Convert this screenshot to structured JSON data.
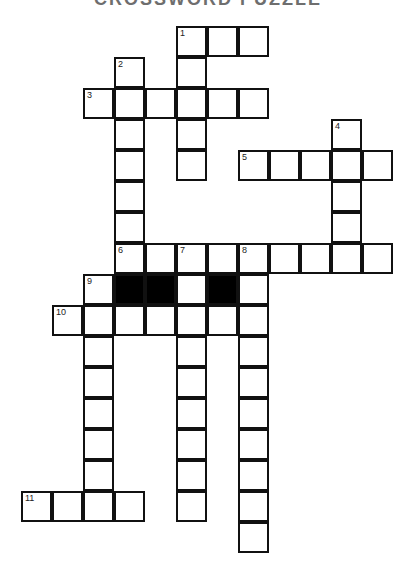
{
  "title": "CROSSWORD PUZZLE",
  "grid": {
    "origin_x": 22,
    "origin_y": 27,
    "cell_size": 31,
    "border_color": "#111111",
    "block_color": "#000000"
  },
  "clue_numbers": [
    {
      "number": "1",
      "row": 0,
      "col": 5
    },
    {
      "number": "2",
      "row": 1,
      "col": 3
    },
    {
      "number": "3",
      "row": 2,
      "col": 2
    },
    {
      "number": "4",
      "row": 3,
      "col": 10
    },
    {
      "number": "5",
      "row": 4,
      "col": 7
    },
    {
      "number": "6",
      "row": 7,
      "col": 3
    },
    {
      "number": "7",
      "row": 7,
      "col": 5
    },
    {
      "number": "8",
      "row": 7,
      "col": 7
    },
    {
      "number": "9",
      "row": 8,
      "col": 2
    },
    {
      "number": "10",
      "row": 9,
      "col": 1
    },
    {
      "number": "11",
      "row": 15,
      "col": 0
    }
  ],
  "entries": [
    {
      "number": "1",
      "direction": "across",
      "row": 0,
      "col": 5,
      "length": 3
    },
    {
      "number": "1",
      "direction": "down",
      "row": 0,
      "col": 5,
      "length": 5
    },
    {
      "number": "2",
      "direction": "down",
      "row": 1,
      "col": 3,
      "length": 7
    },
    {
      "number": "3",
      "direction": "across",
      "row": 2,
      "col": 2,
      "length": 6
    },
    {
      "number": "4",
      "direction": "down",
      "row": 3,
      "col": 10,
      "length": 5
    },
    {
      "number": "5",
      "direction": "across",
      "row": 4,
      "col": 7,
      "length": 5
    },
    {
      "number": "6",
      "direction": "across",
      "row": 7,
      "col": 3,
      "length": 9
    },
    {
      "number": "7",
      "direction": "down",
      "row": 7,
      "col": 5,
      "length": 9
    },
    {
      "number": "8",
      "direction": "down",
      "row": 7,
      "col": 7,
      "length": 10
    },
    {
      "number": "9",
      "direction": "down",
      "row": 8,
      "col": 2,
      "length": 8
    },
    {
      "number": "10",
      "direction": "across",
      "row": 9,
      "col": 1,
      "length": 7
    },
    {
      "number": "11",
      "direction": "across",
      "row": 15,
      "col": 0,
      "length": 4
    }
  ],
  "blocks": [
    {
      "row": 8,
      "col": 3
    },
    {
      "row": 8,
      "col": 4
    },
    {
      "row": 8,
      "col": 6
    }
  ]
}
